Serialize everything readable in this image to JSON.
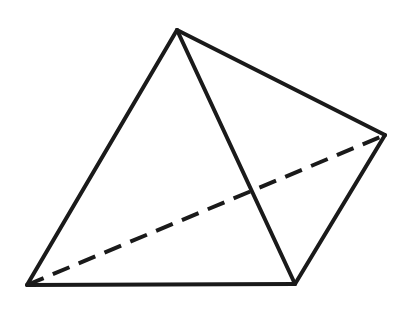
{
  "diagram": {
    "type": "tetrahedron",
    "stroke_color": "#1a1a1a",
    "background": "#ffffff",
    "stroke_width": 4,
    "vertices": {
      "apex": [
        177,
        30
      ],
      "right": [
        385,
        135
      ],
      "bottom_left": [
        27,
        285
      ],
      "bottom_right": [
        295,
        284
      ]
    },
    "edges": [
      {
        "from": "apex",
        "to": "bottom_left",
        "style": "solid"
      },
      {
        "from": "apex",
        "to": "bottom_right",
        "style": "solid"
      },
      {
        "from": "apex",
        "to": "right",
        "style": "solid"
      },
      {
        "from": "bottom_left",
        "to": "bottom_right",
        "style": "solid"
      },
      {
        "from": "bottom_right",
        "to": "right",
        "style": "solid"
      },
      {
        "from": "bottom_left",
        "to": "right",
        "style": "dashed",
        "dash": "18 10"
      }
    ]
  }
}
